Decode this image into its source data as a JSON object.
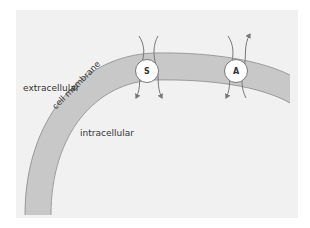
{
  "diagram": {
    "labels": {
      "extracellular": "extracellular",
      "intracellular": "intracellular",
      "membrane": "cell membrane"
    },
    "transporters": [
      {
        "id": "S",
        "label": "S",
        "flux": [
          "in",
          "in"
        ]
      },
      {
        "id": "A",
        "label": "A",
        "flux": [
          "in",
          "out"
        ]
      }
    ],
    "colors": {
      "background": "#f1f1f1",
      "membrane": "#c8c8c8",
      "membrane_edge": "#8a8a8a",
      "arrow": "#777777",
      "transporter_fill": "#ffffff"
    }
  }
}
